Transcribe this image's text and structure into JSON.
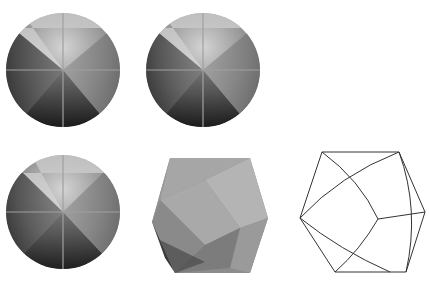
{
  "figure": {
    "panels": [
      {
        "id": "sphere-1",
        "kind": "shaded-sphere",
        "cx": 63,
        "cy": 70,
        "r": 57
      },
      {
        "id": "sphere-2",
        "kind": "shaded-sphere",
        "cx": 203,
        "cy": 70,
        "r": 57
      },
      {
        "id": "sphere-3",
        "kind": "shaded-sphere",
        "cx": 63,
        "cy": 212,
        "r": 57
      },
      {
        "id": "polyhedron",
        "kind": "shaded-polyhedron"
      },
      {
        "id": "wireframe",
        "kind": "wireframe-polyhedron"
      }
    ],
    "colors": {
      "background": "#ffffff",
      "light": "#c8c8c8",
      "mid": "#8a8a8a",
      "dark": "#2a2a2a",
      "line": "#333333",
      "axis": "#9a9a9a"
    }
  }
}
